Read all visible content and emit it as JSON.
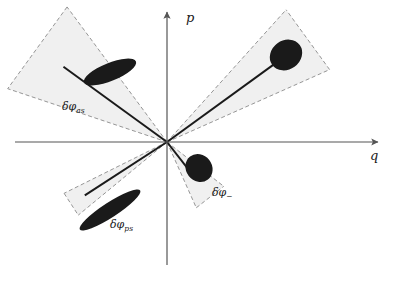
{
  "figure": {
    "type": "phase-space-diagram",
    "background_color": "#ffffff",
    "stroke_color": "#1a1a1a",
    "wedge_fill_color": "#f0f0f0",
    "wedge_edge_color": "#8a8a8a",
    "blob_fill_color": "#1a1a1a",
    "axis_color": "#555555",
    "origin": {
      "x": 167,
      "y": 142
    }
  },
  "axes": {
    "vertical": {
      "label": "p",
      "name": "momentum-axis",
      "x": 167,
      "y_top": 12,
      "y_bottom": 265,
      "label_x": 186,
      "label_y": 22
    },
    "horizontal": {
      "label": "q",
      "name": "position-axis",
      "y": 142,
      "x_left": 15,
      "x_right": 378,
      "label_x": 370,
      "label_y": 160
    }
  },
  "wedges": [
    {
      "id": "as",
      "name": "antisqueezed-wedge",
      "label_main": "δφ",
      "label_sub": "as",
      "angle_center_deg": 144,
      "half_angle_deg": 17.5,
      "radius": 168,
      "label_x": 62,
      "label_y": 110,
      "blob": {
        "name": "antisqueezed-blob",
        "cx": 110,
        "cy": 72,
        "rx": 28,
        "ry": 9,
        "rotation_deg": 22
      },
      "radial_line": {
        "length": 128
      }
    },
    {
      "id": "plus",
      "name": "phase-plus-wedge",
      "label_main": "δφ",
      "label_sub": "+",
      "angle_center_deg": 36,
      "half_angle_deg": 12,
      "radius": 178,
      "label_x": 275,
      "label_y": 57,
      "blob": {
        "name": "phase-plus-blob",
        "cx": 286,
        "cy": 55,
        "rx": 17,
        "ry": 14.5,
        "rotation_deg": 36
      },
      "radial_line": {
        "length": 147
      }
    },
    {
      "id": "minus",
      "name": "phase-minus-wedge",
      "label_main": "δφ",
      "label_sub": "−",
      "angle_center_deg": -52,
      "half_angle_deg": 14,
      "radius": 72,
      "label_x": 212,
      "label_y": 196,
      "blob": {
        "name": "phase-minus-blob",
        "cx": 199,
        "cy": 168,
        "rx": 14.5,
        "ry": 13,
        "rotation_deg": -52
      },
      "radial_line": {
        "length": 42
      }
    },
    {
      "id": "ps",
      "name": "phase-squeezed-wedge",
      "label_main": "δφ",
      "label_sub": "ps",
      "angle_center_deg": -147,
      "half_angle_deg": 6.5,
      "radius": 115,
      "label_x": 110,
      "label_y": 228,
      "blob": {
        "name": "phase-squeezed-blob",
        "cx": 110,
        "cy": 210,
        "rx": 36,
        "ry": 7.5,
        "rotation_deg": 33
      },
      "radial_line": {
        "length": 98
      }
    }
  ]
}
